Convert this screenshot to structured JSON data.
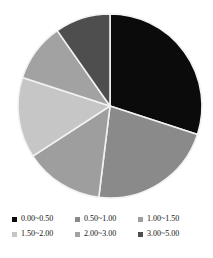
{
  "chart_data": {
    "type": "pie",
    "title": "",
    "categories": [
      "0.00~0.50",
      "0.50~1.00",
      "1.00~1.50",
      "1.50~2.00",
      "2.00~3.00",
      "3.00~5.00"
    ],
    "values": [
      30,
      22,
      14,
      14,
      10,
      10
    ],
    "units": "percent",
    "start_angle_deg": 0,
    "direction": "clockwise",
    "slice_colors": [
      "#0b0b0b",
      "#8a8a8a",
      "#9e9e9e",
      "#c6c6c6",
      "#a2a2a2",
      "#4e4e4e"
    ],
    "slice_edge_color": "#f2f2f2",
    "legend_position": "bottom",
    "legend_columns": 3,
    "grid": false,
    "xlabel": "",
    "ylabel": "",
    "slices": [
      {
        "label": "0.00~0.50",
        "value": 30,
        "color": "#0b0b0b",
        "start_deg": 0,
        "end_deg": 108
      },
      {
        "label": "0.50~1.00",
        "value": 22,
        "color": "#8a8a8a",
        "start_deg": 108,
        "end_deg": 187
      },
      {
        "label": "1.00~1.50",
        "value": 14,
        "color": "#9e9e9e",
        "start_deg": 187,
        "end_deg": 237
      },
      {
        "label": "1.50~2.00",
        "value": 14,
        "color": "#c6c6c6",
        "start_deg": 237,
        "end_deg": 288
      },
      {
        "label": "2.00~3.00",
        "value": 10,
        "color": "#a2a2a2",
        "start_deg": 288,
        "end_deg": 325
      },
      {
        "label": "3.00~5.00",
        "value": 10,
        "color": "#4e4e4e",
        "start_deg": 325,
        "end_deg": 360
      }
    ]
  },
  "legend": {
    "rows": [
      [
        {
          "label": "0.00~0.50",
          "color": "#0b0b0b"
        },
        {
          "label": "0.50~1.00",
          "color": "#8a8a8a"
        },
        {
          "label": "1.00~1.50",
          "color": "#9e9e9e"
        }
      ],
      [
        {
          "label": "1.50~2.00",
          "color": "#c6c6c6"
        },
        {
          "label": "2.00~3.00",
          "color": "#a2a2a2"
        },
        {
          "label": "3.00~5.00",
          "color": "#4e4e4e"
        }
      ]
    ]
  },
  "figure": {
    "background": "#ffffff",
    "center_x": 110,
    "center_y": 106,
    "radius": 92
  }
}
